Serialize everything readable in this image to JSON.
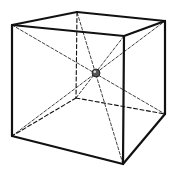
{
  "diagram": {
    "colors": {
      "background": "#ffffff",
      "stroke": "#111111",
      "sphere_fill": "#555555",
      "sphere_highlight": "#dddddd"
    },
    "vertices": {
      "front_top_left": [
        12,
        25
      ],
      "front_top_right": [
        124,
        36
      ],
      "front_bottom_left": [
        12,
        136
      ],
      "front_bottom_right": [
        123,
        164
      ],
      "back_top_left": [
        77,
        12
      ],
      "back_top_right": [
        165,
        21
      ],
      "back_bottom_left": [
        76,
        98
      ],
      "back_bottom_right": [
        165,
        114
      ]
    },
    "center_sphere": {
      "cx": 96,
      "cy": 73,
      "r": 4
    },
    "visible_edges": [
      [
        "front_top_left",
        "front_top_right"
      ],
      [
        "front_top_right",
        "front_bottom_right"
      ],
      [
        "front_bottom_right",
        "front_bottom_left"
      ],
      [
        "front_bottom_left",
        "front_top_left"
      ],
      [
        "front_top_left",
        "back_top_left"
      ],
      [
        "back_top_left",
        "back_top_right"
      ],
      [
        "back_top_right",
        "front_top_right"
      ],
      [
        "back_top_right",
        "back_bottom_right"
      ],
      [
        "back_bottom_right",
        "front_bottom_right"
      ]
    ],
    "hidden_edges": [
      [
        "back_top_left",
        "back_bottom_left"
      ],
      [
        "back_bottom_left",
        "front_bottom_left"
      ],
      [
        "back_bottom_left",
        "back_bottom_right"
      ]
    ],
    "diagonals": [
      [
        "front_top_left",
        "back_bottom_right"
      ],
      [
        "front_top_right",
        "back_bottom_left"
      ],
      [
        "front_bottom_left",
        "back_top_right"
      ],
      [
        "front_bottom_right",
        "back_top_left"
      ]
    ]
  }
}
